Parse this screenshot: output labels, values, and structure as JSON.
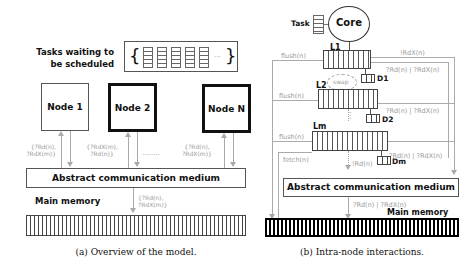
{
  "left": {
    "tasks_label_line1": "Tasks waiting to",
    "tasks_label_line2": "be scheduled",
    "queue_open_brace": "{",
    "queue_close_brace": "}",
    "queue_ellipsis": "...",
    "queue_task_count": 5,
    "nodes": [
      {
        "label": "Node 1",
        "style": "thin",
        "annotation_line1": "{?Rd(n),",
        "annotation_line2": "?RdX(m)}"
      },
      {
        "label": "Node 2",
        "style": "thick",
        "annotation_line1": "{?RdX(m),",
        "annotation_line2": "?Rd(n)}"
      },
      {
        "label": "Node N",
        "style": "thick",
        "annotation_line1": "{?Rd(n),",
        "annotation_line2": "?RdX(m)}"
      }
    ],
    "dots": "........",
    "medium_label": "Abstract communication medium",
    "memory_label": "Main memory",
    "memory_annotation_line1": "{?Rd(n),",
    "memory_annotation_line2": "?RdX(m)}",
    "caption": "(a) Overview of the model."
  },
  "right": {
    "task_label": "Task",
    "core_label": "Core",
    "levels": [
      {
        "label": "L1",
        "flush": "flush(n)",
        "dir": "D1",
        "req": "?Rd(n) | ?RdX(n)"
      },
      {
        "label": "L2",
        "flush": "flush(n)",
        "dir": "D2",
        "req": "?Rd(n) | ?RdX(n)"
      },
      {
        "label": "Lm",
        "flush": "flush(n)",
        "dir": "Dm",
        "req": "?Rd(n) | ?RdX(n)"
      }
    ],
    "top_request": "!RdX(n)",
    "swap_label": "swap",
    "vertical_dots": ":",
    "fetch_label": "fetch(n)",
    "lm_down_label": "!Rd(n)",
    "medium_label": "Abstract communication medium",
    "medium_request": "?Rd(n) | ?RdX(n)",
    "memory_label": "Main memory",
    "caption": "(b) Intra-node interactions."
  }
}
